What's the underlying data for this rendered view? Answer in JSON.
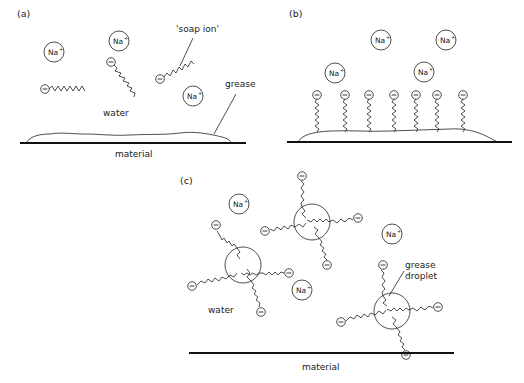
{
  "figure": {
    "panels": [
      {
        "id": "a",
        "label": "(a)",
        "labels": {
          "soap_ion": "'soap ion'",
          "grease": "grease",
          "water": "water",
          "material": "material"
        },
        "sodium_ions": [
          "Na+",
          "Na+",
          "Na+"
        ],
        "soap_ion_count": 3
      },
      {
        "id": "b",
        "label": "(b)",
        "sodium_ions": [
          "Na+",
          "Na+",
          "Na+",
          "Na+"
        ],
        "soap_ion_count": 7
      },
      {
        "id": "c",
        "label": "(c)",
        "labels": {
          "water": "water",
          "grease_droplet_line1": "grease",
          "grease_droplet_line2": "droplet",
          "material": "material"
        },
        "sodium_ions": [
          "Na+",
          "Na+",
          "Na+",
          "Na+"
        ],
        "grease_droplet_count": 3
      }
    ],
    "ion_text": {
      "base": "Na",
      "charge": "+"
    },
    "anion_symbol": "−"
  }
}
